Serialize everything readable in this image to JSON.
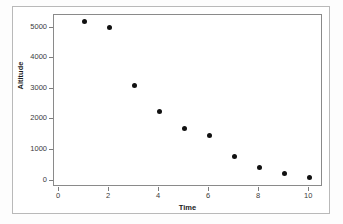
{
  "chart_data": {
    "type": "scatter",
    "title": "",
    "xlabel": "Time",
    "ylabel": "Altitude",
    "x": [
      1,
      2,
      3,
      4,
      5,
      6,
      7,
      8,
      9,
      10
    ],
    "values": [
      5200,
      5000,
      3100,
      2250,
      1700,
      1480,
      800,
      430,
      230,
      100
    ],
    "series": [
      {
        "name": "Altitude",
        "x": [
          1,
          2,
          3,
          4,
          5,
          6,
          7,
          8,
          9,
          10
        ],
        "values": [
          5200,
          5000,
          3100,
          2250,
          1700,
          1480,
          800,
          430,
          230,
          100
        ]
      }
    ],
    "xlim": [
      -0.2,
      10.55
    ],
    "ylim": [
      -210,
      5410
    ],
    "xticks": [
      0,
      2,
      4,
      6,
      8,
      10
    ],
    "xtick_labels": [
      "0",
      "2",
      "4",
      "6",
      "8",
      "10"
    ],
    "yticks": [
      0,
      1000,
      2000,
      3000,
      4000,
      5000
    ],
    "ytick_labels": [
      "0",
      "1000",
      "2000",
      "3000",
      "4000",
      "5000"
    ],
    "grid": false,
    "legend": false,
    "marker": "filled-circle",
    "marker_color": "#111111",
    "panel_background": "#ffffff",
    "frame_color": "#8a8a8a",
    "outer_border_color": "#b9b9b9"
  }
}
